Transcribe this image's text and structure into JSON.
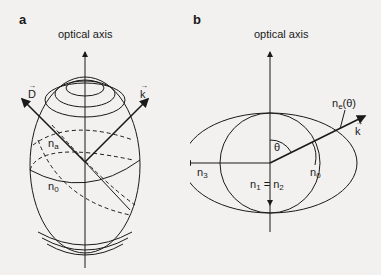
{
  "panels": {
    "a": {
      "letter": "a",
      "axis_title": "optical axis",
      "labels": {
        "D_vector": "D",
        "k_vector": "k",
        "n_a": "n",
        "n_a_sub": "a",
        "n_0": "n",
        "n_0_sub": "0"
      },
      "vector_arrow": "→"
    },
    "b": {
      "letter": "b",
      "axis_title": "optical axis",
      "labels": {
        "n_e_theta": "n",
        "n_e_sub": "e",
        "n_e_arg": "(θ)",
        "k_vector": "k",
        "theta": "θ",
        "n_3": "n",
        "n_3_sub": "3",
        "n_0": "n",
        "n_0_sub": "0",
        "n_1": "n",
        "n_1_sub": "1",
        "equals": " = ",
        "n_2": "n",
        "n_2_sub": "2"
      },
      "vector_arrow": "→"
    }
  },
  "colors": {
    "background": "#f2f1ef",
    "ink": "#1a1a1a"
  }
}
